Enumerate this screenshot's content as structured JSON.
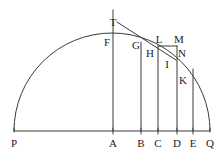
{
  "figure": {
    "type": "geometric-diagram",
    "width": 223,
    "height": 162,
    "background_color": "#ffffff",
    "stroke_color": "#3a3a3a",
    "label_color": "#1c1c1c",
    "stroke_width": 1
  },
  "geometry": {
    "semicircle": {
      "name": "arc-PQ",
      "center_x": 112,
      "center_y": 131,
      "radius": 98,
      "start_label": "P",
      "end_label": "Q"
    },
    "baseline": {
      "name": "diameter-PQ",
      "x1": 14,
      "y1": 131,
      "x2": 210,
      "y2": 131
    },
    "tangent": {
      "name": "tangent-line",
      "x1": 117,
      "y1": 22,
      "x2": 176,
      "y2": 60
    },
    "axis_vertical": {
      "name": "ordinate-at-A",
      "x": 113,
      "y_top": 10,
      "y_bottom": 131
    },
    "ordinates": [
      {
        "label": "A",
        "x": 113,
        "y_top": 10,
        "y_bottom": 131
      },
      {
        "label": "B",
        "x": 141,
        "y_top": 42,
        "y_bottom": 131
      },
      {
        "label": "C",
        "x": 158,
        "y_top": 46,
        "y_bottom": 131
      },
      {
        "label": "D",
        "x": 177,
        "y_top": 46,
        "y_bottom": 131
      },
      {
        "label": "E",
        "x": 193,
        "y_top": 69,
        "y_bottom": 131
      }
    ],
    "horizontal_segments": [
      {
        "name": "segment-L-M",
        "x1": 158,
        "y1": 46,
        "x2": 177,
        "y2": 46
      }
    ],
    "baseline_ticks": [
      {
        "label": "P",
        "x": 14
      },
      {
        "label": "A",
        "x": 113
      },
      {
        "label": "B",
        "x": 141
      },
      {
        "label": "C",
        "x": 158
      },
      {
        "label": "D",
        "x": 177
      },
      {
        "label": "E",
        "x": 193
      },
      {
        "label": "Q",
        "x": 210
      }
    ]
  },
  "labels": {
    "points": [
      {
        "id": "T",
        "text": "T",
        "x": 113,
        "y": 22,
        "anchor": "right-of-axis"
      },
      {
        "id": "F",
        "text": "F",
        "x": 107,
        "y": 42,
        "anchor": "left-of-axis"
      },
      {
        "id": "G",
        "text": "G",
        "x": 136,
        "y": 45,
        "anchor": "left-of-B"
      },
      {
        "id": "L",
        "text": "L",
        "x": 159,
        "y": 39,
        "anchor": "above-C"
      },
      {
        "id": "M",
        "text": "M",
        "x": 179,
        "y": 39,
        "anchor": "above-D"
      },
      {
        "id": "H",
        "text": "H",
        "x": 150,
        "y": 53,
        "anchor": "right-of-B"
      },
      {
        "id": "N",
        "text": "N",
        "x": 182,
        "y": 53,
        "anchor": "right-of-D"
      },
      {
        "id": "I",
        "text": "I",
        "x": 167,
        "y": 64,
        "anchor": "between-C-D"
      },
      {
        "id": "K",
        "text": "K",
        "x": 183,
        "y": 80,
        "anchor": "right-of-D"
      }
    ],
    "baseline": [
      {
        "id": "P",
        "text": "P",
        "x": 14,
        "y": 143
      },
      {
        "id": "A",
        "text": "A",
        "x": 113,
        "y": 143
      },
      {
        "id": "B",
        "text": "B",
        "x": 141,
        "y": 143
      },
      {
        "id": "C",
        "text": "C",
        "x": 158,
        "y": 143
      },
      {
        "id": "D",
        "text": "D",
        "x": 177,
        "y": 143
      },
      {
        "id": "E",
        "text": "E",
        "x": 193,
        "y": 143
      },
      {
        "id": "Q",
        "text": "Q",
        "x": 210,
        "y": 143
      }
    ]
  }
}
